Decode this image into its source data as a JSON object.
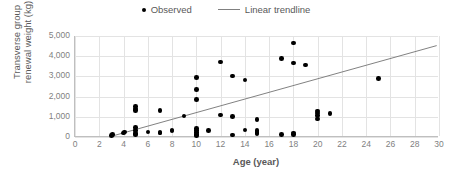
{
  "legend": {
    "position": "top-center",
    "entries": [
      {
        "label": "Observed",
        "marker": "dot",
        "color": "#000000",
        "icon": "scatter-dot-icon"
      },
      {
        "label": "Linear trendline",
        "marker": "line",
        "color": "#808080",
        "icon": "trendline-icon"
      }
    ]
  },
  "chart_data": {
    "type": "scatter",
    "title": "",
    "xlabel": "Age (year)",
    "ylabel": "Transverse group\nrenewal weight (kg)",
    "xlim": [
      0,
      30
    ],
    "ylim": [
      0,
      5000
    ],
    "xticks": [
      0,
      2,
      4,
      6,
      8,
      10,
      12,
      14,
      16,
      18,
      20,
      22,
      24,
      26,
      28,
      30
    ],
    "xtick_labels": [
      "0",
      "2",
      "4",
      "6",
      "8",
      "10",
      "12",
      "14",
      "16",
      "18",
      "20",
      "22",
      "24",
      "26",
      "28",
      "30"
    ],
    "yticks": [
      0,
      1000,
      2000,
      3000,
      4000,
      5000
    ],
    "ytick_labels": [
      "0",
      "1,000",
      "2,000",
      "3,000",
      "4,000",
      "5,000"
    ],
    "grid": true,
    "grid_color": "#e3e3e3",
    "axis_color": "#bfbfbf",
    "series": [
      {
        "name": "Observed",
        "type": "scatter",
        "color": "#000000",
        "points": [
          [
            3.0,
            60
          ],
          [
            3.1,
            120
          ],
          [
            4.0,
            200
          ],
          [
            4.1,
            250
          ],
          [
            5.0,
            1510
          ],
          [
            5.0,
            1390
          ],
          [
            5.0,
            1300
          ],
          [
            5.0,
            470
          ],
          [
            5.0,
            330
          ],
          [
            5.0,
            180
          ],
          [
            5.0,
            110
          ],
          [
            6.0,
            240
          ],
          [
            7.0,
            1300
          ],
          [
            7.0,
            230
          ],
          [
            7.0,
            190
          ],
          [
            8.0,
            340
          ],
          [
            8.0,
            290
          ],
          [
            9.0,
            1040
          ],
          [
            10.0,
            2950
          ],
          [
            10.0,
            2340
          ],
          [
            10.0,
            1850
          ],
          [
            10.0,
            420
          ],
          [
            10.0,
            310
          ],
          [
            10.0,
            220
          ],
          [
            10.0,
            130
          ],
          [
            10.0,
            60
          ],
          [
            11.0,
            330
          ],
          [
            12.0,
            3720
          ],
          [
            12.0,
            1080
          ],
          [
            13.0,
            3020
          ],
          [
            13.0,
            1010
          ],
          [
            13.0,
            100
          ],
          [
            14.0,
            2820
          ],
          [
            14.0,
            340
          ],
          [
            15.0,
            880
          ],
          [
            15.0,
            330
          ],
          [
            15.0,
            230
          ],
          [
            15.0,
            180
          ],
          [
            17.0,
            3880
          ],
          [
            17.0,
            120
          ],
          [
            18.0,
            4650
          ],
          [
            18.0,
            3670
          ],
          [
            18.0,
            200
          ],
          [
            18.0,
            130
          ],
          [
            19.0,
            3560
          ],
          [
            20.0,
            1280
          ],
          [
            20.0,
            1180
          ],
          [
            20.0,
            1060
          ],
          [
            20.0,
            900
          ],
          [
            21.0,
            1160
          ],
          [
            25.0,
            2910
          ]
        ]
      },
      {
        "name": "Linear trendline",
        "type": "line",
        "color": "#808080",
        "endpoints": [
          [
            3.0,
            0
          ],
          [
            30.0,
            4520
          ]
        ]
      }
    ]
  }
}
